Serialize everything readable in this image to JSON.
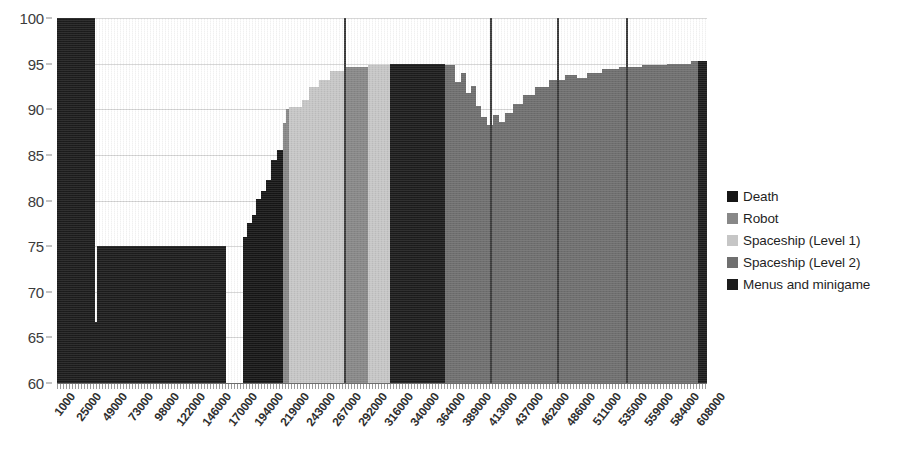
{
  "chart_data": {
    "type": "area",
    "title": "",
    "xlabel": "",
    "ylabel": "",
    "ylim": [
      60,
      100
    ],
    "y_ticks": [
      60,
      65,
      70,
      75,
      80,
      85,
      90,
      95,
      100
    ],
    "grid": true,
    "legend_position": "right",
    "x_tick_labels": [
      "1000",
      "25000",
      "49000",
      "73000",
      "98000",
      "122000",
      "146000",
      "170000",
      "194000",
      "219000",
      "243000",
      "267000",
      "292000",
      "316000",
      "340000",
      "364000",
      "389000",
      "413000",
      "437000",
      "462000",
      "486000",
      "511000",
      "535000",
      "559000",
      "584000",
      "608000"
    ],
    "series": [
      {
        "name": "Death",
        "color": "#161616"
      },
      {
        "name": "Robot",
        "color": "#888888"
      },
      {
        "name": "Spaceship (Level 1)",
        "color": "#c6c6c6"
      },
      {
        "name": "Spaceship (Level 2)",
        "color": "#6f6f6f"
      },
      {
        "name": "Menus and minigame",
        "color": "#1c1c1c"
      }
    ],
    "vertical_separators_x": [
      344,
      490,
      557,
      626
    ],
    "segments": [
      {
        "series": "Menus and minigame",
        "x0": 0,
        "x1": 38,
        "y": 100.0
      },
      {
        "series": "Menus and minigame",
        "x0": 38,
        "x1": 40,
        "y": 66.7
      },
      {
        "series": "Menus and minigame",
        "x0": 40,
        "x1": 169,
        "y": 75.0
      },
      {
        "series": "Menus and minigame",
        "x0": 169,
        "x1": 186,
        "y": 60.0
      },
      {
        "series": "Death",
        "x0": 186,
        "x1": 190,
        "y": 76.0
      },
      {
        "series": "Death",
        "x0": 190,
        "x1": 195,
        "y": 77.5
      },
      {
        "series": "Death",
        "x0": 195,
        "x1": 199,
        "y": 78.4
      },
      {
        "series": "Death",
        "x0": 199,
        "x1": 204,
        "y": 80.2
      },
      {
        "series": "Death",
        "x0": 204,
        "x1": 209,
        "y": 81.0
      },
      {
        "series": "Death",
        "x0": 209,
        "x1": 214,
        "y": 82.2
      },
      {
        "series": "Death",
        "x0": 214,
        "x1": 220,
        "y": 84.4
      },
      {
        "series": "Death",
        "x0": 220,
        "x1": 226,
        "y": 85.5
      },
      {
        "series": "Robot",
        "x0": 226,
        "x1": 229,
        "y": 88.5
      },
      {
        "series": "Robot",
        "x0": 229,
        "x1": 232,
        "y": 90.0
      },
      {
        "series": "Spaceship (Level 1)",
        "x0": 232,
        "x1": 245,
        "y": 90.2
      },
      {
        "series": "Spaceship (Level 1)",
        "x0": 245,
        "x1": 252,
        "y": 91.0
      },
      {
        "series": "Spaceship (Level 1)",
        "x0": 252,
        "x1": 262,
        "y": 92.4
      },
      {
        "series": "Spaceship (Level 1)",
        "x0": 262,
        "x1": 273,
        "y": 93.2
      },
      {
        "series": "Spaceship (Level 1)",
        "x0": 273,
        "x1": 288,
        "y": 94.2
      },
      {
        "series": "Robot",
        "x0": 288,
        "x1": 311,
        "y": 94.6
      },
      {
        "series": "Spaceship (Level 1)",
        "x0": 311,
        "x1": 333,
        "y": 94.8
      },
      {
        "series": "Menus and minigame",
        "x0": 333,
        "x1": 388,
        "y": 95.0
      },
      {
        "series": "Spaceship (Level 2)",
        "x0": 388,
        "x1": 398,
        "y": 94.8
      },
      {
        "series": "Spaceship (Level 2)",
        "x0": 398,
        "x1": 404,
        "y": 93.0
      },
      {
        "series": "Spaceship (Level 2)",
        "x0": 404,
        "x1": 409,
        "y": 94.0
      },
      {
        "series": "Spaceship (Level 2)",
        "x0": 409,
        "x1": 414,
        "y": 91.8
      },
      {
        "series": "Spaceship (Level 2)",
        "x0": 414,
        "x1": 419,
        "y": 92.6
      },
      {
        "series": "Spaceship (Level 2)",
        "x0": 419,
        "x1": 424,
        "y": 90.4
      },
      {
        "series": "Spaceship (Level 2)",
        "x0": 424,
        "x1": 430,
        "y": 89.2
      },
      {
        "series": "Spaceship (Level 2)",
        "x0": 430,
        "x1": 436,
        "y": 88.3
      },
      {
        "series": "Spaceship (Level 2)",
        "x0": 436,
        "x1": 442,
        "y": 89.4
      },
      {
        "series": "Spaceship (Level 2)",
        "x0": 442,
        "x1": 448,
        "y": 88.6
      },
      {
        "series": "Spaceship (Level 2)",
        "x0": 448,
        "x1": 456,
        "y": 89.6
      },
      {
        "series": "Spaceship (Level 2)",
        "x0": 456,
        "x1": 466,
        "y": 90.6
      },
      {
        "series": "Spaceship (Level 2)",
        "x0": 466,
        "x1": 478,
        "y": 91.6
      },
      {
        "series": "Spaceship (Level 2)",
        "x0": 478,
        "x1": 492,
        "y": 92.4
      },
      {
        "series": "Spaceship (Level 2)",
        "x0": 492,
        "x1": 508,
        "y": 93.2
      },
      {
        "series": "Spaceship (Level 2)",
        "x0": 508,
        "x1": 520,
        "y": 93.8
      },
      {
        "series": "Spaceship (Level 2)",
        "x0": 520,
        "x1": 530,
        "y": 93.4
      },
      {
        "series": "Spaceship (Level 2)",
        "x0": 530,
        "x1": 545,
        "y": 94.0
      },
      {
        "series": "Spaceship (Level 2)",
        "x0": 545,
        "x1": 562,
        "y": 94.4
      },
      {
        "series": "Spaceship (Level 2)",
        "x0": 562,
        "x1": 585,
        "y": 94.6
      },
      {
        "series": "Spaceship (Level 2)",
        "x0": 585,
        "x1": 610,
        "y": 94.8
      },
      {
        "series": "Spaceship (Level 2)",
        "x0": 610,
        "x1": 634,
        "y": 95.0
      },
      {
        "series": "Spaceship (Level 2)",
        "x0": 634,
        "x1": 641,
        "y": 95.3
      },
      {
        "series": "Menus and minigame",
        "x0": 641,
        "x1": 650,
        "y": 95.3
      }
    ]
  },
  "legend": {
    "items": [
      {
        "label": "Death",
        "color": "#161616"
      },
      {
        "label": "Robot",
        "color": "#888888"
      },
      {
        "label": "Spaceship (Level 1)",
        "color": "#c6c6c6"
      },
      {
        "label": "Spaceship (Level 2)",
        "color": "#6f6f6f"
      },
      {
        "label": "Menus and minigame",
        "color": "#1c1c1c"
      }
    ]
  }
}
